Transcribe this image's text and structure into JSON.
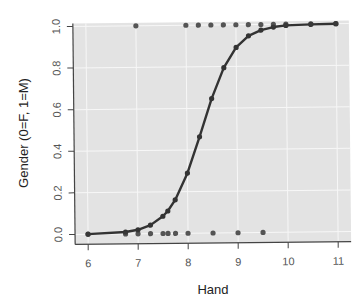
{
  "chart_data": {
    "type": "scatter",
    "title": "",
    "xlabel": "Hand",
    "ylabel": "Gender (0=F, 1=M)",
    "xlim": [
      6,
      11
    ],
    "ylim": [
      0,
      1
    ],
    "x_ticks": [
      "6",
      "7",
      "8",
      "9",
      "10",
      "11"
    ],
    "x_tick_values": [
      6,
      7,
      8,
      9,
      10,
      11
    ],
    "y_ticks": [
      "0.0",
      "0.2",
      "0.4",
      "0.6",
      "0.8",
      "1.0"
    ],
    "y_tick_values": [
      0,
      0.2,
      0.4,
      0.6,
      0.8,
      1.0
    ],
    "grid": true,
    "legend": "none",
    "series": [
      {
        "name": "Observed (female)",
        "kind": "points",
        "x": [
          6.0,
          6.75,
          7.0,
          7.25,
          7.5,
          7.6,
          7.75,
          8.0,
          8.5,
          9.0,
          9.5
        ],
        "y": [
          0,
          0,
          0,
          0,
          0,
          0,
          0,
          0,
          0,
          0,
          0
        ]
      },
      {
        "name": "Observed (male)",
        "kind": "points",
        "x": [
          7.0,
          8.0,
          8.25,
          8.5,
          8.75,
          9.0,
          9.25,
          9.5,
          9.75,
          10.0,
          10.5,
          11.0
        ],
        "y": [
          1,
          1,
          1,
          1,
          1,
          1,
          1,
          1,
          1,
          1,
          1,
          1
        ]
      },
      {
        "name": "Fitted logistic curve",
        "kind": "line",
        "x": [
          6.0,
          6.75,
          7.0,
          7.25,
          7.5,
          7.6,
          7.75,
          8.0,
          8.25,
          8.5,
          8.75,
          9.0,
          9.25,
          9.5,
          9.75,
          10.0,
          10.5,
          11.0
        ],
        "y": [
          0.001,
          0.009,
          0.019,
          0.041,
          0.083,
          0.108,
          0.161,
          0.289,
          0.463,
          0.646,
          0.794,
          0.891,
          0.946,
          0.973,
          0.987,
          0.994,
          0.998,
          1.0
        ]
      }
    ]
  },
  "colors": {
    "panel_bg": "#e3e3e3",
    "grid": "#f7f7f7",
    "point": "#3a3a3a",
    "line": "#333333",
    "axis": "#444444"
  }
}
